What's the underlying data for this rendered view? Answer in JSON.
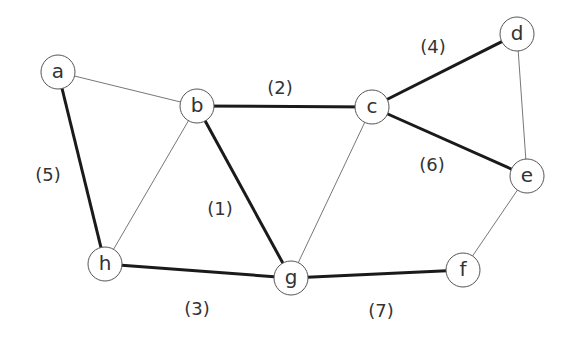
{
  "graph": {
    "nodes": [
      {
        "id": "a",
        "label": "a",
        "x": 58,
        "y": 72
      },
      {
        "id": "b",
        "label": "b",
        "x": 197,
        "y": 106
      },
      {
        "id": "c",
        "label": "c",
        "x": 372,
        "y": 107
      },
      {
        "id": "d",
        "label": "d",
        "x": 517,
        "y": 34
      },
      {
        "id": "e",
        "label": "e",
        "x": 527,
        "y": 176
      },
      {
        "id": "f",
        "label": "f",
        "x": 463,
        "y": 270
      },
      {
        "id": "g",
        "label": "g",
        "x": 291,
        "y": 278
      },
      {
        "id": "h",
        "label": "h",
        "x": 105,
        "y": 264
      }
    ],
    "edges": [
      {
        "from": "a",
        "to": "b",
        "style": "thin"
      },
      {
        "from": "a",
        "to": "h",
        "style": "thick",
        "label": "(5)",
        "lx": 48,
        "ly": 174
      },
      {
        "from": "b",
        "to": "c",
        "style": "thick",
        "label": "(2)",
        "lx": 280,
        "ly": 87
      },
      {
        "from": "b",
        "to": "h",
        "style": "thin"
      },
      {
        "from": "b",
        "to": "g",
        "style": "thick",
        "label": "(1)",
        "lx": 220,
        "ly": 208
      },
      {
        "from": "c",
        "to": "d",
        "style": "thick",
        "label": "(4)",
        "lx": 433,
        "ly": 46
      },
      {
        "from": "c",
        "to": "e",
        "style": "thick",
        "label": "(6)",
        "lx": 432,
        "ly": 164
      },
      {
        "from": "c",
        "to": "g",
        "style": "thin"
      },
      {
        "from": "d",
        "to": "e",
        "style": "thin"
      },
      {
        "from": "e",
        "to": "f",
        "style": "thin"
      },
      {
        "from": "h",
        "to": "g",
        "style": "thick",
        "label": "(3)",
        "lx": 197,
        "ly": 308
      },
      {
        "from": "g",
        "to": "f",
        "style": "thick",
        "label": "(7)",
        "lx": 381,
        "ly": 310
      }
    ]
  },
  "node_radius": 17
}
